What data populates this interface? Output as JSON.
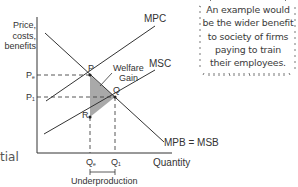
{
  "diagram": {
    "y_axis_label": "Price,\ncosts,\nbenefits",
    "x_axis_label": "Quantity",
    "curves": [
      {
        "name": "MPC",
        "label": "MPC"
      },
      {
        "name": "MSC",
        "label": "MSC"
      },
      {
        "name": "MPB",
        "label": "MPB = MSB"
      }
    ],
    "points": {
      "P": "P",
      "Q": "Q",
      "R": "R"
    },
    "price_labels": {
      "pe_main": "P",
      "pe_sub": "e",
      "p1_main": "P",
      "p1_sub": "1"
    },
    "quantity_labels": {
      "qe_main": "Q",
      "qe_sub": "e",
      "q1_main": "Q",
      "q1_sub": "1"
    },
    "welfare_gain_label": "Welfare\nGain",
    "underproduction_label": "Underproduction",
    "colors": {
      "line": "#333333",
      "shade": "#a9a9a9"
    }
  },
  "callout": {
    "lines": [
      "An example would",
      "be the wider benefit",
      "to society of firms",
      "paying to train",
      "their employees."
    ]
  },
  "partial_text": "tial"
}
